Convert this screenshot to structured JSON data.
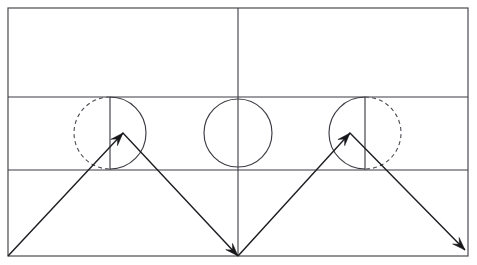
{
  "diagram": {
    "stroke_color": "#3c3c44",
    "trajectory_color": "#17171b",
    "background_color": "#ffffff",
    "table": {
      "label": "billiard-table-outline",
      "x": 8,
      "y": 8,
      "width": 460,
      "height": 248
    },
    "horizontal_lines": [
      {
        "label": "upper-rail-line",
        "y": 97
      },
      {
        "label": "lower-rail-line",
        "y": 170
      }
    ],
    "vertical_lines": [
      {
        "label": "center-line",
        "x": 238,
        "y1": 8,
        "y2": 256
      }
    ],
    "circles": [
      {
        "label": "left-ball-circle",
        "cx": 110,
        "cy": 133,
        "r": 36,
        "left_half": "dashed",
        "right_half": "solid",
        "diameter_line": {
          "x": 110,
          "y1": 97,
          "y2": 170
        }
      },
      {
        "label": "center-ball-circle",
        "cx": 238,
        "cy": 133,
        "r": 34,
        "left_half": "solid",
        "right_half": "solid",
        "diameter_line": null
      },
      {
        "label": "right-ball-circle",
        "cx": 365,
        "cy": 133,
        "r": 36,
        "left_half": "solid",
        "right_half": "dashed",
        "diameter_line": {
          "x": 365,
          "y1": 97,
          "y2": 170
        }
      }
    ],
    "trajectories": [
      {
        "label": "left-trajectory",
        "points": "8,256 123,133 238,256",
        "arrowheads": [
          {
            "label": "left-apex-arrowhead",
            "x": 123,
            "y": 133,
            "angle": -46.9
          },
          {
            "label": "center-bottom-arrowhead",
            "x": 238,
            "y": 256,
            "angle": 46.9
          }
        ]
      },
      {
        "label": "right-trajectory",
        "points": "238,256 350,133 465,250",
        "arrowheads": [
          {
            "label": "right-apex-arrowhead",
            "x": 350,
            "y": 133,
            "angle": -47.7
          },
          {
            "label": "right-bottom-arrowhead",
            "x": 465,
            "y": 250,
            "angle": 45.5
          }
        ]
      }
    ]
  }
}
